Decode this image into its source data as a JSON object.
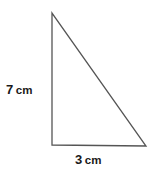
{
  "figure": {
    "type": "right-triangle-diagram",
    "background_color": "#ffffff",
    "stroke_color": "#555555",
    "text_color": "#1a1a1a",
    "width": 154,
    "height": 169,
    "vertices": {
      "apex": [
        52,
        13
      ],
      "bottom_left": [
        52,
        145
      ],
      "bottom_right": [
        146,
        146
      ]
    },
    "right_angle_at": "bottom-left",
    "right_angle_marker_shown": false
  },
  "labels": {
    "vertical_leg": {
      "name": "height",
      "value": "7",
      "unit": "cm",
      "full": "7 cm",
      "position": [
        24,
        88
      ],
      "side": "left"
    },
    "horizontal_leg": {
      "name": "base",
      "value": "3",
      "unit": "cm",
      "full": "3 cm",
      "position": [
        98,
        158
      ],
      "side": "bottom"
    }
  }
}
